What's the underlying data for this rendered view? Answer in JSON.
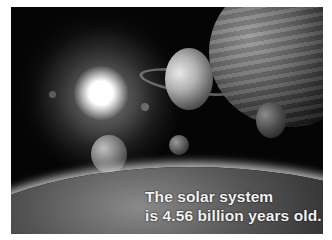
{
  "image": {
    "description": "Solar system illustration: bright sun, ringed planet, gas giant, moons and Earth horizon (grayscale)",
    "caption_lines": [
      "The solar system",
      "is 4.56 billion years old."
    ]
  }
}
